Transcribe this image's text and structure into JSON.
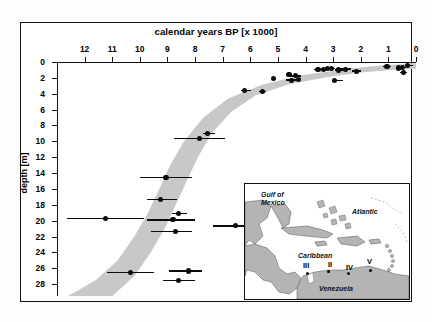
{
  "figure": {
    "x_axis_title": "calendar years BP [x 1000]",
    "y_axis_title": "depth [m]"
  },
  "chart_data": {
    "type": "scatter",
    "title": "calendar years BP [x 1000]",
    "xlabel": "calendar years BP [x 1000]",
    "ylabel": "depth [m]",
    "xlim": [
      13,
      0
    ],
    "ylim": [
      29.5,
      0
    ],
    "x_reversed": true,
    "y_reversed": true,
    "grid": false,
    "legend": "none",
    "xticks": [
      12,
      11,
      10,
      9,
      8,
      7,
      6,
      5,
      4,
      3,
      2,
      1,
      0
    ],
    "xticklabels": [
      "12",
      "11",
      "10",
      "9",
      "8",
      "7",
      "6",
      "5",
      "4",
      "3",
      "2",
      "1",
      "0"
    ],
    "yticks": [
      0,
      2,
      4,
      6,
      8,
      10,
      12,
      14,
      16,
      18,
      20,
      22,
      24,
      26,
      28
    ],
    "yticklabels": [
      "0",
      "2",
      "4",
      "6",
      "8",
      "10",
      "12",
      "14",
      "16",
      "18",
      "20",
      "22",
      "24",
      "26",
      "28"
    ],
    "series": [
      {
        "name": "radiocarbon-dated sea-level index points",
        "marker": "filled-circle",
        "error_bars": "horizontal",
        "points": [
          {
            "x": 5.15,
            "y": 2.05,
            "xerr_low": 0.0,
            "xerr_high": 0.0
          },
          {
            "x": 4.6,
            "y": 1.55,
            "xerr_low": 0.1,
            "xerr_high": 0.1
          },
          {
            "x": 4.5,
            "y": 2.3,
            "xerr_low": 0.0,
            "xerr_high": 0.0
          },
          {
            "x": 4.35,
            "y": 1.75,
            "xerr_low": 0.2,
            "xerr_high": 0.2
          },
          {
            "x": 4.25,
            "y": 2.25,
            "xerr_low": 0.45,
            "xerr_high": 0.0
          },
          {
            "x": 3.55,
            "y": 0.95,
            "xerr_low": 0.15,
            "xerr_high": 0.15
          },
          {
            "x": 3.35,
            "y": 0.95,
            "xerr_low": 0.1,
            "xerr_high": 0.1
          },
          {
            "x": 3.2,
            "y": 0.8,
            "xerr_low": 0.12,
            "xerr_high": 0.12
          },
          {
            "x": 3.05,
            "y": 0.85,
            "xerr_low": 0.1,
            "xerr_high": 0.1
          },
          {
            "x": 2.95,
            "y": 2.35,
            "xerr_low": 0.0,
            "xerr_high": 0.3
          },
          {
            "x": 2.8,
            "y": 1.0,
            "xerr_low": 0.15,
            "xerr_high": 0.15
          },
          {
            "x": 2.55,
            "y": 0.9,
            "xerr_low": 0.35,
            "xerr_high": 0.2
          },
          {
            "x": 2.15,
            "y": 1.15,
            "xerr_low": 0.15,
            "xerr_high": 0.15
          },
          {
            "x": 1.05,
            "y": 0.55,
            "xerr_low": 0.15,
            "xerr_high": 0.15
          },
          {
            "x": 0.62,
            "y": 0.75,
            "xerr_low": 0.1,
            "xerr_high": 0.1
          },
          {
            "x": 0.48,
            "y": 0.7,
            "xerr_low": 0.1,
            "xerr_high": 0.1
          },
          {
            "x": 0.45,
            "y": 1.35,
            "xerr_low": 0.12,
            "xerr_high": 0.12
          },
          {
            "x": 0.3,
            "y": 0.45,
            "xerr_low": 0.1,
            "xerr_high": 0.18
          },
          {
            "x": 6.2,
            "y": 3.6,
            "xerr_low": 0.12,
            "xerr_high": 0.22
          },
          {
            "x": 5.55,
            "y": 3.7,
            "xerr_low": 0.12,
            "xerr_high": 0.12
          },
          {
            "x": 7.55,
            "y": 9.0,
            "xerr_low": 0.18,
            "xerr_high": 0.28
          },
          {
            "x": 7.85,
            "y": 9.65,
            "xerr_low": 0.9,
            "xerr_high": 0.95
          },
          {
            "x": 9.05,
            "y": 14.55,
            "xerr_low": 0.95,
            "xerr_high": 0.95
          },
          {
            "x": 9.25,
            "y": 17.35,
            "xerr_low": 0.5,
            "xerr_high": 0.6
          },
          {
            "x": 11.25,
            "y": 19.7,
            "xerr_low": 1.4,
            "xerr_high": 1.4
          },
          {
            "x": 8.6,
            "y": 19.1,
            "xerr_low": 0.22,
            "xerr_high": 0.3
          },
          {
            "x": 8.8,
            "y": 19.9,
            "xerr_low": 0.95,
            "xerr_high": 0.8
          },
          {
            "x": 8.7,
            "y": 21.35,
            "xerr_low": 0.9,
            "xerr_high": 0.6
          },
          {
            "x": 6.55,
            "y": 20.65,
            "xerr_low": 0.8,
            "xerr_high": 0.75
          },
          {
            "x": 10.35,
            "y": 26.55,
            "xerr_low": 0.85,
            "xerr_high": 0.85
          },
          {
            "x": 8.25,
            "y": 26.35,
            "xerr_low": 0.7,
            "xerr_high": 0.5
          },
          {
            "x": 8.6,
            "y": 27.55,
            "xerr_low": 0.55,
            "xerr_high": 0.6
          }
        ]
      }
    ],
    "envelope": {
      "name": "grey sea-level envelope band",
      "fill": "#c8c8c8",
      "upper_curve": [
        {
          "x": 12.6,
          "y": 29.5
        },
        {
          "x": 11.6,
          "y": 27.5
        },
        {
          "x": 10.8,
          "y": 25.0
        },
        {
          "x": 10.2,
          "y": 22.0
        },
        {
          "x": 9.7,
          "y": 19.0
        },
        {
          "x": 9.3,
          "y": 16.0
        },
        {
          "x": 8.9,
          "y": 13.0
        },
        {
          "x": 8.4,
          "y": 10.0
        },
        {
          "x": 7.7,
          "y": 7.0
        },
        {
          "x": 6.8,
          "y": 4.6
        },
        {
          "x": 5.6,
          "y": 2.9
        },
        {
          "x": 4.2,
          "y": 1.7
        },
        {
          "x": 2.6,
          "y": 0.9
        },
        {
          "x": 1.2,
          "y": 0.4
        },
        {
          "x": 0.0,
          "y": 0.15
        }
      ],
      "lower_curve": [
        {
          "x": 11.0,
          "y": 29.5
        },
        {
          "x": 10.2,
          "y": 27.0
        },
        {
          "x": 9.6,
          "y": 24.0
        },
        {
          "x": 9.1,
          "y": 21.0
        },
        {
          "x": 8.7,
          "y": 18.0
        },
        {
          "x": 8.3,
          "y": 15.0
        },
        {
          "x": 7.9,
          "y": 12.0
        },
        {
          "x": 7.4,
          "y": 9.0
        },
        {
          "x": 6.7,
          "y": 6.3
        },
        {
          "x": 5.8,
          "y": 4.2
        },
        {
          "x": 4.6,
          "y": 2.8
        },
        {
          "x": 3.2,
          "y": 1.9
        },
        {
          "x": 1.9,
          "y": 1.3
        },
        {
          "x": 0.9,
          "y": 1.0
        },
        {
          "x": 0.0,
          "y": 0.85
        }
      ]
    }
  },
  "inset_map": {
    "region_labels": [
      {
        "text": "Gulf of",
        "x": 16,
        "y": 7
      },
      {
        "text": "Mexico",
        "x": 16,
        "y": 15
      },
      {
        "text": "Atlantic",
        "x": 107,
        "y": 24
      },
      {
        "text": "Caribbean",
        "x": 53,
        "y": 68
      },
      {
        "text": "Venezuela",
        "x": 74,
        "y": 101
      }
    ],
    "sites": [
      {
        "label": "III",
        "lx": 58,
        "ly": 77,
        "dx": 61,
        "dy": 88
      },
      {
        "label": "II",
        "lx": 83,
        "ly": 76,
        "dx": 82,
        "dy": 86
      },
      {
        "label": "IV",
        "lx": 101,
        "ly": 79,
        "dx": 102,
        "dy": 88
      },
      {
        "label": "V",
        "lx": 122,
        "ly": 73,
        "dx": 124,
        "dy": 85
      }
    ],
    "land_color": "#b4b4b4",
    "sea_color": "#ffffff"
  }
}
